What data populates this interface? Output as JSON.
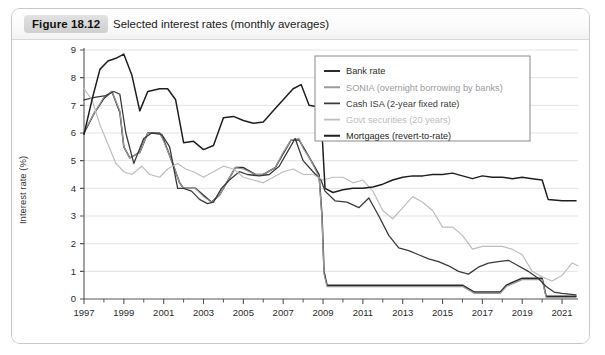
{
  "figure": {
    "badge": "Figure 18.12",
    "caption": "Selected interest rates (monthly averages)"
  },
  "chart_data": {
    "type": "line",
    "title": "Selected interest rates (monthly averages)",
    "xlabel": "",
    "ylabel": "Interest rate (%)",
    "xlim": [
      1997,
      2021.8
    ],
    "ylim": [
      0,
      9
    ],
    "grid": true,
    "legend_position": "top-right",
    "xticks": [
      1997,
      1999,
      2001,
      2003,
      2005,
      2007,
      2009,
      2011,
      2013,
      2015,
      2017,
      2019,
      2021
    ],
    "xticklabels": [
      "1997",
      "1999",
      "2001",
      "2003",
      "2005",
      "2007",
      "2009",
      "2011",
      "2013",
      "2015",
      "2017",
      "2019",
      "2021"
    ],
    "xminorticks": [
      1998,
      2000,
      2002,
      2004,
      2006,
      2008,
      2010,
      2012,
      2014,
      2016,
      2018,
      2020
    ],
    "yticks": [
      0,
      1,
      2,
      3,
      4,
      5,
      6,
      7,
      8,
      9
    ],
    "yticklabels": [
      "0",
      "1",
      "2",
      "3",
      "4",
      "5",
      "6",
      "7",
      "8",
      "9"
    ],
    "colors": {
      "bank_rate": "#2b2b2b",
      "sonia": "#9a9a9a",
      "cash_isa": "#3a3a3a",
      "govt_securities": "#bdbdbd",
      "mortgages": "#1f1f1f",
      "grid": "#e3e3e3",
      "axis": "#555555"
    },
    "series": [
      {
        "name": "Bank rate",
        "color": "#2b2b2b",
        "width": 1.5,
        "x": [
          1997.0,
          1997.5,
          1998.0,
          1998.4,
          1998.8,
          1999.0,
          1999.3,
          1999.8,
          2000.2,
          2000.8,
          2001.0,
          2001.4,
          2001.8,
          2002.0,
          2002.6,
          2003.0,
          2003.4,
          2003.8,
          2004.2,
          2004.6,
          2005.0,
          2005.6,
          2006.0,
          2006.6,
          2007.0,
          2007.4,
          2007.8,
          2008.0,
          2008.4,
          2008.8,
          2008.95,
          2009.05,
          2009.2,
          2010.0,
          2011.0,
          2012.0,
          2013.0,
          2014.0,
          2015.0,
          2016.0,
          2016.6,
          2017.0,
          2017.9,
          2018.2,
          2019.0,
          2020.0,
          2020.2,
          2021.0,
          2021.7
        ],
        "y": [
          6.0,
          6.7,
          7.25,
          7.5,
          6.75,
          5.5,
          5.1,
          5.3,
          6.0,
          6.0,
          5.75,
          5.0,
          4.2,
          4.0,
          4.0,
          3.75,
          3.5,
          3.75,
          4.25,
          4.75,
          4.75,
          4.5,
          4.5,
          4.75,
          5.25,
          5.75,
          5.75,
          5.5,
          5.0,
          4.5,
          3.0,
          1.0,
          0.5,
          0.5,
          0.5,
          0.5,
          0.5,
          0.5,
          0.5,
          0.5,
          0.25,
          0.25,
          0.25,
          0.5,
          0.75,
          0.75,
          0.1,
          0.1,
          0.1
        ]
      },
      {
        "name": "SONIA (overnight borrowing by banks)",
        "color": "#9a9a9a",
        "width": 1.2,
        "x": [
          1997.0,
          1997.5,
          1998.0,
          1998.4,
          1998.8,
          1999.0,
          1999.3,
          1999.8,
          2000.2,
          2000.8,
          2001.0,
          2001.4,
          2001.8,
          2002.0,
          2002.6,
          2003.0,
          2003.4,
          2003.8,
          2004.2,
          2004.6,
          2005.0,
          2005.6,
          2006.0,
          2006.6,
          2007.0,
          2007.4,
          2007.8,
          2008.0,
          2008.4,
          2008.8,
          2008.95,
          2009.05,
          2009.2,
          2010.0,
          2011.0,
          2012.0,
          2013.0,
          2014.0,
          2015.0,
          2016.0,
          2016.6,
          2017.0,
          2017.9,
          2018.2,
          2019.0,
          2020.0,
          2020.2,
          2021.0,
          2021.7
        ],
        "y": [
          6.05,
          6.7,
          7.3,
          7.5,
          6.8,
          5.5,
          5.1,
          5.3,
          6.0,
          6.0,
          5.7,
          5.0,
          4.2,
          4.0,
          4.0,
          3.7,
          3.5,
          3.75,
          4.25,
          4.75,
          4.7,
          4.5,
          4.5,
          4.75,
          5.3,
          5.75,
          5.8,
          5.45,
          5.0,
          4.4,
          2.9,
          0.9,
          0.45,
          0.45,
          0.45,
          0.45,
          0.45,
          0.45,
          0.45,
          0.45,
          0.2,
          0.2,
          0.2,
          0.45,
          0.7,
          0.7,
          0.06,
          0.05,
          0.05
        ]
      },
      {
        "name": "Cash ISA (2-year fixed rate)",
        "color": "#3a3a3a",
        "width": 1.3,
        "x": [
          1997.0,
          1997.6,
          1998.1,
          1998.5,
          1998.8,
          1999.1,
          1999.5,
          2000.0,
          2000.4,
          2000.9,
          2001.3,
          2001.7,
          2002.0,
          2002.4,
          2002.8,
          2003.2,
          2003.5,
          2003.9,
          2004.3,
          2004.8,
          2005.2,
          2005.8,
          2006.3,
          2006.8,
          2007.2,
          2007.6,
          2008.0,
          2008.5,
          2008.9,
          2009.1,
          2009.6,
          2010.2,
          2010.8,
          2011.3,
          2011.8,
          2012.3,
          2012.8,
          2013.3,
          2013.8,
          2014.3,
          2014.8,
          2015.3,
          2015.8,
          2016.3,
          2016.8,
          2017.3,
          2017.8,
          2018.3,
          2018.8,
          2019.3,
          2019.8,
          2020.2,
          2020.6,
          2021.0,
          2021.7
        ],
        "y": [
          7.2,
          7.3,
          7.35,
          7.5,
          7.4,
          6.0,
          4.9,
          5.8,
          6.0,
          5.95,
          5.5,
          4.0,
          4.0,
          3.9,
          3.6,
          3.45,
          3.5,
          4.0,
          4.3,
          4.6,
          4.5,
          4.45,
          4.5,
          4.8,
          5.3,
          5.8,
          5.0,
          4.6,
          4.3,
          3.9,
          3.55,
          3.5,
          3.3,
          3.65,
          3.0,
          2.3,
          1.85,
          1.75,
          1.6,
          1.45,
          1.35,
          1.2,
          1.0,
          0.9,
          1.15,
          1.3,
          1.35,
          1.4,
          1.2,
          1.0,
          0.75,
          0.45,
          0.25,
          0.2,
          0.15
        ]
      },
      {
        "name": "Govt securities (20 years)",
        "color": "#bdbdbd",
        "width": 1.2,
        "x": [
          1997.0,
          1997.4,
          1997.8,
          1998.2,
          1998.6,
          1999.0,
          1999.4,
          1999.9,
          2000.3,
          2000.8,
          2001.2,
          2001.7,
          2002.1,
          2002.5,
          2003.0,
          2003.5,
          2004.0,
          2004.5,
          2005.0,
          2005.5,
          2006.0,
          2006.5,
          2007.0,
          2007.5,
          2008.0,
          2008.5,
          2009.0,
          2009.5,
          2010.0,
          2010.5,
          2011.0,
          2011.5,
          2012.0,
          2012.5,
          2013.0,
          2013.5,
          2014.0,
          2014.5,
          2015.0,
          2015.5,
          2016.0,
          2016.5,
          2017.0,
          2017.5,
          2018.0,
          2018.5,
          2019.0,
          2019.5,
          2020.0,
          2020.5,
          2021.0,
          2021.5,
          2021.8
        ],
        "y": [
          7.6,
          7.2,
          6.3,
          5.6,
          4.9,
          4.6,
          4.5,
          4.8,
          4.5,
          4.4,
          4.7,
          4.9,
          4.7,
          4.6,
          4.4,
          4.6,
          4.8,
          4.7,
          4.4,
          4.3,
          4.2,
          4.4,
          4.6,
          4.7,
          4.5,
          4.5,
          4.3,
          4.4,
          4.4,
          4.2,
          4.3,
          3.9,
          3.2,
          2.9,
          3.3,
          3.7,
          3.5,
          3.2,
          2.6,
          2.6,
          2.3,
          1.8,
          1.9,
          1.9,
          1.9,
          1.8,
          1.6,
          1.0,
          0.8,
          0.65,
          0.85,
          1.3,
          1.2
        ]
      },
      {
        "name": "Mortgages (revert-to-rate)",
        "color": "#1f1f1f",
        "width": 1.5,
        "x": [
          1997.0,
          1997.4,
          1997.8,
          1998.2,
          1998.6,
          1999.0,
          1999.4,
          1999.8,
          2000.2,
          2000.8,
          2001.2,
          2001.6,
          2002.0,
          2002.5,
          2003.0,
          2003.5,
          2004.0,
          2004.5,
          2005.0,
          2005.5,
          2006.0,
          2006.5,
          2007.0,
          2007.5,
          2007.9,
          2008.3,
          2008.7,
          2008.95,
          2009.1,
          2009.5,
          2010.0,
          2010.5,
          2011.0,
          2011.5,
          2012.0,
          2012.5,
          2013.0,
          2013.5,
          2014.0,
          2014.5,
          2015.0,
          2015.5,
          2016.0,
          2016.5,
          2017.0,
          2017.5,
          2018.0,
          2018.5,
          2019.0,
          2019.5,
          2020.0,
          2020.3,
          2021.0,
          2021.7
        ],
        "y": [
          5.95,
          7.2,
          8.3,
          8.6,
          8.7,
          8.85,
          8.1,
          6.8,
          7.5,
          7.6,
          7.6,
          7.2,
          5.65,
          5.7,
          5.4,
          5.55,
          6.55,
          6.6,
          6.45,
          6.35,
          6.4,
          6.8,
          7.2,
          7.6,
          7.75,
          7.0,
          6.95,
          6.0,
          4.0,
          3.85,
          3.95,
          4.0,
          4.0,
          4.05,
          4.15,
          4.3,
          4.4,
          4.45,
          4.45,
          4.5,
          4.5,
          4.55,
          4.45,
          4.35,
          4.45,
          4.4,
          4.4,
          4.35,
          4.4,
          4.35,
          4.3,
          3.6,
          3.55,
          3.55
        ]
      }
    ]
  },
  "legend": {
    "items": [
      {
        "label": "Bank rate",
        "color": "#2b2b2b"
      },
      {
        "label": "SONIA (overnight borrowing by banks)",
        "color": "#9a9a9a"
      },
      {
        "label": "Cash ISA (2-year fixed rate)",
        "color": "#3a3a3a"
      },
      {
        "label": "Govt securities (20 years)",
        "color": "#bdbdbd"
      },
      {
        "label": "Mortgages (revert-to-rate)",
        "color": "#1f1f1f"
      }
    ]
  }
}
